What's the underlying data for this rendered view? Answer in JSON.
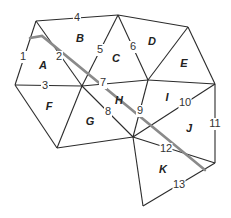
{
  "diagram": {
    "type": "planar graph / region map with labeled edges and regions",
    "vertices": {
      "P1": [
        36,
        21
      ],
      "P2": [
        118,
        15
      ],
      "P3": [
        188,
        27
      ],
      "P4": [
        15,
        85
      ],
      "P5": [
        82,
        86
      ],
      "P6": [
        148,
        80
      ],
      "P7": [
        215,
        84
      ],
      "P8": [
        57,
        148
      ],
      "P9": [
        133,
        137
      ],
      "P10": [
        215,
        163
      ],
      "P11": [
        143,
        206
      ]
    },
    "edges": [
      {
        "label": "1",
        "from": "P1",
        "to": "P4",
        "label_pos": [
          23,
          57
        ]
      },
      {
        "label": "2",
        "from": "P1",
        "to": "P5",
        "label_pos": [
          59,
          57
        ]
      },
      {
        "label": "3",
        "from": "P4",
        "to": "P5",
        "label_pos": [
          45,
          86
        ]
      },
      {
        "label": "4",
        "from": "P1",
        "to": "P2",
        "label_pos": [
          77,
          18
        ]
      },
      {
        "label": "5",
        "from": "P2",
        "to": "P5",
        "label_pos": [
          100,
          50
        ]
      },
      {
        "label": "6",
        "from": "P2",
        "to": "P6",
        "label_pos": [
          133,
          47
        ]
      },
      {
        "label": "7",
        "from": "P5",
        "to": "P6",
        "label_pos": [
          103,
          83
        ]
      },
      {
        "label": "8",
        "from": "P5",
        "to": "P9",
        "label_pos": [
          108,
          112
        ]
      },
      {
        "label": "9",
        "from": "P6",
        "to": "P9",
        "label_pos": [
          140,
          111
        ]
      },
      {
        "label": "10",
        "from": "P9",
        "to": "P7",
        "label_pos": [
          185,
          103
        ]
      },
      {
        "label": "11",
        "from": "P7",
        "to": "P10",
        "label_pos": [
          215,
          124
        ]
      },
      {
        "label": "12",
        "from": "P9",
        "to": "P10",
        "label_pos": [
          166,
          149
        ]
      },
      {
        "label": "13",
        "from": "P10",
        "to": "P11",
        "label_pos": [
          179,
          185
        ]
      },
      {
        "label": "",
        "from": "P2",
        "to": "P3"
      },
      {
        "label": "",
        "from": "P3",
        "to": "P6"
      },
      {
        "label": "",
        "from": "P3",
        "to": "P7"
      },
      {
        "label": "",
        "from": "P6",
        "to": "P7"
      },
      {
        "label": "",
        "from": "P4",
        "to": "P8"
      },
      {
        "label": "",
        "from": "P5",
        "to": "P8"
      },
      {
        "label": "",
        "from": "P8",
        "to": "P9"
      },
      {
        "label": "",
        "from": "P9",
        "to": "P11"
      }
    ],
    "regions": [
      {
        "label": "A",
        "pos": [
          43,
          66
        ]
      },
      {
        "label": "B",
        "pos": [
          80,
          39
        ]
      },
      {
        "label": "C",
        "pos": [
          116,
          59
        ]
      },
      {
        "label": "D",
        "pos": [
          152,
          42
        ]
      },
      {
        "label": "E",
        "pos": [
          184,
          64
        ]
      },
      {
        "label": "F",
        "pos": [
          49,
          107
        ]
      },
      {
        "label": "G",
        "pos": [
          90,
          122
        ]
      },
      {
        "label": "H",
        "pos": [
          119,
          101
        ]
      },
      {
        "label": "I",
        "pos": [
          167,
          98
        ]
      },
      {
        "label": "J",
        "pos": [
          189,
          129
        ]
      },
      {
        "label": "K",
        "pos": [
          163,
          170
        ]
      }
    ],
    "road": {
      "points": [
        [
          30,
          38
        ],
        [
          42,
          36
        ],
        [
          205,
          170
        ]
      ],
      "color": "#8a8a8a"
    },
    "colors": {
      "edge": "#2b2b2b",
      "road": "#8a8a8a",
      "background": "#ffffff"
    }
  }
}
